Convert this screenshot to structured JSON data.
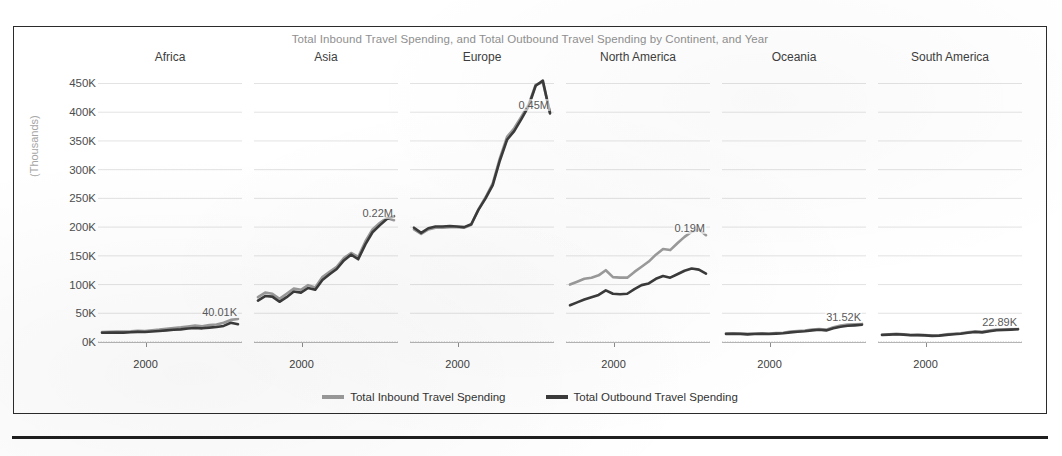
{
  "chart_data": {
    "type": "line",
    "title": "Total Inbound Travel Spending, and Total Outbound Travel Spending by Continent, and Year",
    "xlabel": "",
    "ylabel": "(Thousands)",
    "ylim": [
      0,
      470000
    ],
    "yticks": [
      0,
      50000,
      100000,
      150000,
      200000,
      250000,
      300000,
      350000,
      400000,
      450000
    ],
    "ytick_labels": [
      "0K",
      "50K",
      "100K",
      "150K",
      "200K",
      "250K",
      "300K",
      "350K",
      "400K",
      "450K"
    ],
    "grid": true,
    "legend_position": "bottom",
    "facet_by": "Continent",
    "x": [
      1995,
      1996,
      1997,
      1998,
      1999,
      2000,
      2001,
      2002,
      2003,
      2004,
      2005,
      2006,
      2007,
      2008,
      2009,
      2010,
      2011,
      2012,
      2013,
      2014
    ],
    "xtick_labels": [
      "2000"
    ],
    "legend": [
      {
        "name": "Total Inbound Travel Spending",
        "color": "#9b9b9b"
      },
      {
        "name": "Total Outbound Travel Spending",
        "color": "#3b3b3b"
      }
    ],
    "panels": [
      {
        "name": "Africa",
        "xtick_label": "2000",
        "end_label": "40.01K",
        "series": [
          {
            "name": "Total Inbound Travel Spending",
            "values": [
              17500,
              17800,
              18200,
              18000,
              18600,
              19500,
              19200,
              20500,
              21500,
              23000,
              24500,
              25500,
              27000,
              28500,
              27500,
              29500,
              30500,
              33500,
              38500,
              40010
            ]
          },
          {
            "name": "Total Outbound Travel Spending",
            "values": [
              16000,
              16300,
              16600,
              16400,
              17000,
              17600,
              17400,
              18400,
              19200,
              20200,
              21200,
              22000,
              23500,
              24500,
              23800,
              25000,
              26000,
              28000,
              33500,
              31000
            ]
          }
        ]
      },
      {
        "name": "Asia",
        "xtick_label": "2000",
        "end_label": "0.22M",
        "series": [
          {
            "name": "Total Inbound Travel Spending",
            "values": [
              78000,
              86000,
              84000,
              75000,
              84000,
              93000,
              91000,
              99000,
              95000,
              113000,
              122000,
              131000,
              146000,
              155000,
              148000,
              175000,
              196000,
              207000,
              216000,
              212000
            ]
          },
          {
            "name": "Total Outbound Travel Spending",
            "values": [
              72000,
              80000,
              79000,
              70000,
              78000,
              88000,
              86000,
              94000,
              91000,
              108000,
              118000,
              127000,
              142000,
              152000,
              144000,
              170000,
              191000,
              203000,
              214000,
              219000
            ]
          }
        ]
      },
      {
        "name": "Europe",
        "xtick_label": "2000",
        "end_label": "0.45M",
        "series": [
          {
            "name": "Total Inbound Travel Spending",
            "values": [
              196000,
              188000,
              196000,
              199000,
              199000,
              200000,
              200000,
              199000,
              204000,
              231000,
              252000,
              276000,
              320000,
              357000,
              372000,
              392000,
              413000,
              448000,
              452000,
              400000
            ]
          },
          {
            "name": "Total Outbound Travel Spending",
            "values": [
              199000,
              190000,
              198000,
              201000,
              201000,
              202000,
              201000,
              200000,
              205000,
              230000,
              250000,
              273000,
              316000,
              352000,
              367000,
              388000,
              410000,
              446000,
              455000,
              398000
            ]
          }
        ]
      },
      {
        "name": "North America",
        "xtick_label": "2000",
        "end_label": "0.19M",
        "series": [
          {
            "name": "Total Inbound Travel Spending",
            "values": [
              100000,
              105000,
              110000,
              112000,
              116000,
              125000,
              113000,
              112000,
              112000,
              122000,
              131000,
              140000,
              152000,
              162000,
              160000,
              172000,
              183000,
              192000,
              196000,
              186000
            ]
          },
          {
            "name": "Total Outbound Travel Spending",
            "values": [
              64000,
              69000,
              74000,
              78000,
              82000,
              90000,
              84000,
              83000,
              84000,
              92000,
              99000,
              102000,
              110000,
              115000,
              112000,
              118000,
              124000,
              128000,
              126000,
              119000
            ]
          }
        ]
      },
      {
        "name": "Oceania",
        "xtick_label": "2000",
        "end_label": "31.52K",
        "series": [
          {
            "name": "Total Inbound Travel Spending",
            "values": [
              15000,
              15300,
              15000,
              14200,
              14800,
              15200,
              14800,
              15600,
              16200,
              18000,
              19000,
              19800,
              21500,
              22500,
              21500,
              25500,
              28500,
              30500,
              31000,
              31520
            ]
          },
          {
            "name": "Total Outbound Travel Spending",
            "values": [
              14000,
              14200,
              14000,
              13300,
              13800,
              14200,
              13900,
              14600,
              15200,
              16800,
              17800,
              18600,
              20200,
              21200,
              20200,
              23800,
              26500,
              28200,
              29000,
              30000
            ]
          }
        ]
      },
      {
        "name": "South America",
        "xtick_label": "2000",
        "end_label": "22.89K",
        "series": [
          {
            "name": "Total Inbound Travel Spending",
            "values": [
              13000,
              13600,
              14200,
              13600,
              12400,
              12600,
              12200,
              11200,
              11800,
              13200,
              14200,
              15200,
              17000,
              18500,
              17800,
              19800,
              21500,
              22000,
              22500,
              22890
            ]
          },
          {
            "name": "Total Outbound Travel Spending",
            "values": [
              12200,
              12800,
              13400,
              12800,
              11700,
              11900,
              11500,
              10600,
              11100,
              12400,
              13400,
              14400,
              16100,
              17500,
              16800,
              18700,
              20400,
              21000,
              21600,
              22100
            ]
          }
        ]
      }
    ]
  },
  "page": {
    "bottom_rule": ""
  }
}
